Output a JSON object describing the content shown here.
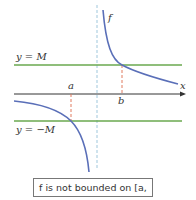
{
  "labels": {
    "f": "f",
    "y_upper": "y = M",
    "y_lower": "y = −M",
    "x_axis": "x",
    "a": "a",
    "b": "b"
  },
  "caption": "f is not bounded on [a, b].",
  "colors": {
    "curve": "#5a6fb8",
    "bound_lines": "#6aa84f",
    "asymptote": "#9fc7dc",
    "markers": "#e07a5f",
    "axis": "#333333"
  }
}
